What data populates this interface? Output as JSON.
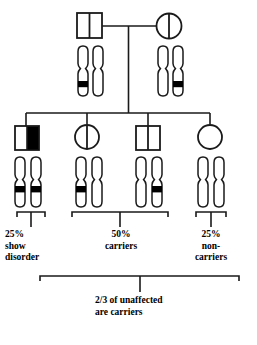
{
  "diagram": {
    "type": "pedigree-chart",
    "title_visible": false,
    "colors": {
      "stroke": "#1a1a1a",
      "fill_affected": "#000000",
      "background": "#ffffff",
      "band": "#000000"
    },
    "generations": [
      {
        "id": "parents",
        "label_visible": false,
        "individuals": [
          {
            "id": "father",
            "symbol": "square",
            "sex": "male",
            "status": "carrier",
            "fill": "half-vertical-line",
            "chromosomes": [
              {
                "band": true
              },
              {
                "band": false
              }
            ]
          },
          {
            "id": "mother",
            "symbol": "circle",
            "sex": "female",
            "status": "carrier",
            "fill": "half-vertical-line",
            "chromosomes": [
              {
                "band": false
              },
              {
                "band": true
              }
            ]
          }
        ]
      },
      {
        "id": "offspring",
        "label_visible": false,
        "individuals": [
          {
            "id": "child-1",
            "symbol": "square",
            "sex": "male",
            "status": "affected",
            "fill": "right-half-filled",
            "chromosomes": [
              {
                "band": true
              },
              {
                "band": true
              }
            ]
          },
          {
            "id": "child-2",
            "symbol": "circle",
            "sex": "female",
            "status": "carrier",
            "fill": "half-vertical-line",
            "chromosomes": [
              {
                "band": true
              },
              {
                "band": false
              }
            ]
          },
          {
            "id": "child-3",
            "symbol": "square",
            "sex": "male",
            "status": "carrier",
            "fill": "half-vertical-line",
            "chromosomes": [
              {
                "band": false
              },
              {
                "band": true
              }
            ]
          },
          {
            "id": "child-4",
            "symbol": "circle",
            "sex": "female",
            "status": "non-carrier",
            "fill": "empty",
            "chromosomes": [
              {
                "band": false
              },
              {
                "band": false
              }
            ]
          }
        ]
      }
    ],
    "brackets": [
      {
        "id": "bracket-affected",
        "spans": [
          "child-1"
        ]
      },
      {
        "id": "bracket-carriers",
        "spans": [
          "child-2",
          "child-3"
        ]
      },
      {
        "id": "bracket-noncarriers",
        "spans": [
          "child-4"
        ]
      },
      {
        "id": "bracket-unaffected-summary",
        "spans": [
          "child-1",
          "child-2",
          "child-3",
          "child-4"
        ]
      }
    ],
    "annotations": {
      "affected": {
        "percent": "25%",
        "line2": "show",
        "line3": "disorder",
        "full": "25%\nshow\ndisorder"
      },
      "carriers": {
        "percent": "50%",
        "line2": "carriers",
        "full": "50%\ncarriers"
      },
      "noncarriers": {
        "percent": "25%",
        "line2": "non-",
        "line3": "carriers",
        "full": "25%\nnon-\ncarriers"
      },
      "summary": {
        "line1": "2/3 of unaffected",
        "line2": "are carriers",
        "full": "2/3 of unaffected\nare carriers"
      }
    }
  }
}
